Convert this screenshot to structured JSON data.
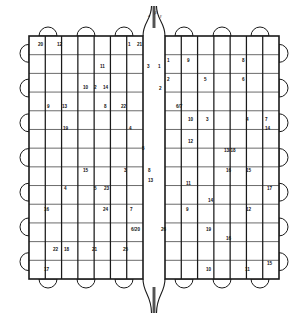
{
  "figure": {
    "kind": "patent-line-drawing",
    "title_visible": false,
    "stroke_color": "#1a1a1a",
    "fill_color": "#ffffff",
    "background": "#ffffff",
    "panels": [
      {
        "name": "left-panel",
        "x": 29,
        "y": 36,
        "w": 114,
        "h": 243
      },
      {
        "name": "right-panel",
        "x": 165,
        "y": 36,
        "w": 114,
        "h": 243
      }
    ],
    "center_channel": {
      "x": 143,
      "w": 22,
      "top_extends_above": true,
      "bottom_extends_below": true
    },
    "grid": {
      "left_columns": 7,
      "right_columns": 7,
      "rows": 13
    },
    "tabs": {
      "top_count": 6,
      "bottom_count": 6,
      "left_count": 7,
      "right_count": 7,
      "shape": "semicircle"
    },
    "axis_labels": [
      {
        "name": "label-alpha",
        "text": "a",
        "x": 148,
        "y": 17
      },
      {
        "name": "label-beta",
        "text": "β",
        "x": 154.5,
        "y": 14
      },
      {
        "name": "label-gamma",
        "text": "γ",
        "x": 160,
        "y": 17
      }
    ],
    "callouts": [
      {
        "text": "20",
        "x": 38,
        "y": 46
      },
      {
        "text": "12",
        "x": 57,
        "y": 46
      },
      {
        "text": "1",
        "x": 128,
        "y": 46
      },
      {
        "text": "21",
        "x": 137,
        "y": 46
      },
      {
        "text": "11",
        "x": 100,
        "y": 68
      },
      {
        "text": "3",
        "x": 147,
        "y": 68
      },
      {
        "text": "1",
        "x": 158,
        "y": 68
      },
      {
        "text": "1",
        "x": 167,
        "y": 62
      },
      {
        "text": "9",
        "x": 187,
        "y": 62
      },
      {
        "text": "8",
        "x": 242,
        "y": 62
      },
      {
        "text": "10",
        "x": 83,
        "y": 89
      },
      {
        "text": "2",
        "x": 94,
        "y": 89
      },
      {
        "text": "14",
        "x": 103,
        "y": 89
      },
      {
        "text": "2",
        "x": 167,
        "y": 81
      },
      {
        "text": "5",
        "x": 204,
        "y": 81
      },
      {
        "text": "6",
        "x": 242,
        "y": 81
      },
      {
        "text": "2",
        "x": 159,
        "y": 90
      },
      {
        "text": "9",
        "x": 47,
        "y": 108
      },
      {
        "text": "13",
        "x": 62,
        "y": 108
      },
      {
        "text": "8",
        "x": 104,
        "y": 108
      },
      {
        "text": "22",
        "x": 121,
        "y": 108
      },
      {
        "text": "6/7",
        "x": 176,
        "y": 108
      },
      {
        "text": "19",
        "x": 63,
        "y": 130
      },
      {
        "text": "4",
        "x": 129,
        "y": 130
      },
      {
        "text": "10",
        "x": 188,
        "y": 121
      },
      {
        "text": "3",
        "x": 206,
        "y": 121
      },
      {
        "text": "4",
        "x": 246,
        "y": 121
      },
      {
        "text": "7",
        "x": 265,
        "y": 121
      },
      {
        "text": "14",
        "x": 265,
        "y": 130
      },
      {
        "text": "5",
        "x": 142,
        "y": 150
      },
      {
        "text": "12",
        "x": 188,
        "y": 143
      },
      {
        "text": "13/18",
        "x": 224,
        "y": 152
      },
      {
        "text": "15",
        "x": 83,
        "y": 172
      },
      {
        "text": "3",
        "x": 124,
        "y": 172
      },
      {
        "text": "8",
        "x": 148,
        "y": 172
      },
      {
        "text": "16",
        "x": 226,
        "y": 172
      },
      {
        "text": "15",
        "x": 246,
        "y": 172
      },
      {
        "text": "13",
        "x": 148,
        "y": 182
      },
      {
        "text": "4",
        "x": 64,
        "y": 190
      },
      {
        "text": "5",
        "x": 94,
        "y": 190
      },
      {
        "text": "23",
        "x": 104,
        "y": 190
      },
      {
        "text": "11",
        "x": 186,
        "y": 185
      },
      {
        "text": "17",
        "x": 267,
        "y": 190
      },
      {
        "text": "14",
        "x": 208,
        "y": 202
      },
      {
        "text": "16",
        "x": 44,
        "y": 211
      },
      {
        "text": "24",
        "x": 103,
        "y": 211
      },
      {
        "text": "7",
        "x": 130,
        "y": 211
      },
      {
        "text": "9",
        "x": 186,
        "y": 211
      },
      {
        "text": "12",
        "x": 246,
        "y": 211
      },
      {
        "text": "6/20",
        "x": 131,
        "y": 231
      },
      {
        "text": "26",
        "x": 161,
        "y": 231
      },
      {
        "text": "19",
        "x": 206,
        "y": 231
      },
      {
        "text": "16",
        "x": 226,
        "y": 240
      },
      {
        "text": "22",
        "x": 53,
        "y": 251
      },
      {
        "text": "18",
        "x": 64,
        "y": 251
      },
      {
        "text": "21",
        "x": 92,
        "y": 251
      },
      {
        "text": "25",
        "x": 123,
        "y": 251
      },
      {
        "text": "15",
        "x": 267,
        "y": 265
      },
      {
        "text": "17",
        "x": 44,
        "y": 271
      },
      {
        "text": "10",
        "x": 206,
        "y": 271
      },
      {
        "text": "11",
        "x": 245,
        "y": 271
      }
    ]
  }
}
